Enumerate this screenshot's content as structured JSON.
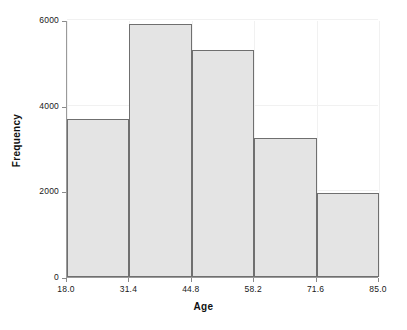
{
  "chart_data": {
    "type": "bar",
    "title": "",
    "subtitle": "",
    "xlabel": "Age",
    "ylabel": "Frequency",
    "xlim": [
      18.0,
      85.0
    ],
    "ylim": [
      0,
      6000
    ],
    "grid": true,
    "legend": null,
    "bin_edges": [
      18.0,
      31.4,
      44.8,
      58.2,
      71.6,
      85.0
    ],
    "categories": [
      "18.0-31.4",
      "31.4-44.8",
      "44.8-58.2",
      "58.2-71.6",
      "71.6-85.0"
    ],
    "values": [
      3700,
      5900,
      5300,
      3250,
      1950
    ],
    "xticks": [
      {
        "value": 18.0,
        "label": "18.0"
      },
      {
        "value": 31.4,
        "label": "31.4"
      },
      {
        "value": 44.8,
        "label": "44.8"
      },
      {
        "value": 58.2,
        "label": "58.2"
      },
      {
        "value": 71.6,
        "label": "71.6"
      },
      {
        "value": 85.0,
        "label": "85.0"
      }
    ],
    "yticks": [
      {
        "value": 0,
        "label": "0"
      },
      {
        "value": 2000,
        "label": "2000"
      },
      {
        "value": 4000,
        "label": "4000"
      },
      {
        "value": 6000,
        "label": "6000"
      }
    ],
    "colors": {
      "bar_fill": "#e4e4e4",
      "bar_edge": "#6f6f6f",
      "axis": "#9a9a9a",
      "grid": "#f1f1f1",
      "background": "#ffffff",
      "text": "#111111"
    }
  }
}
